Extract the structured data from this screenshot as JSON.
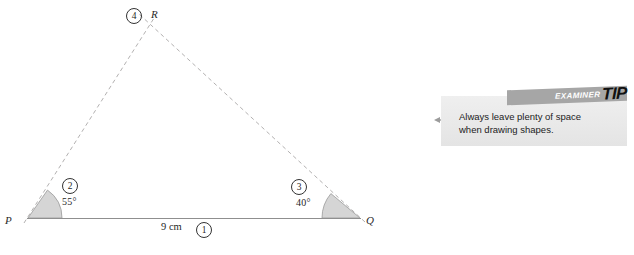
{
  "diagram": {
    "vertices": [
      {
        "name": "vertex-p-label",
        "label": "P",
        "x": 28,
        "y": 218
      },
      {
        "name": "vertex-q-label",
        "label": "Q",
        "x": 360,
        "y": 218
      },
      {
        "name": "vertex-r-label",
        "label": "R",
        "x": 148,
        "y": 28
      }
    ],
    "base_line": {
      "label": "9 cm",
      "from": "P",
      "to": "Q"
    },
    "angles": [
      {
        "at": "P",
        "value": "55°"
      },
      {
        "at": "Q",
        "value": "40°"
      }
    ],
    "step_markers": [
      {
        "id": "1",
        "text": "①",
        "describes": "base-line-9cm"
      },
      {
        "id": "2",
        "text": "②",
        "describes": "angle-at-p-55"
      },
      {
        "id": "3",
        "text": "③",
        "describes": "angle-at-q-40"
      },
      {
        "id": "4",
        "text": "④",
        "describes": "intersection-point-r"
      }
    ],
    "colors": {
      "line": "#8a8a8a",
      "dashed_line": "#b0aeae",
      "angle_fill": "#d4d4d4",
      "text": "#1f1f1f"
    }
  },
  "tip": {
    "banner_prefix": "EXAMINER",
    "banner_word": "TIP",
    "body_line1": "Always leave plenty of space",
    "body_line2": "when drawing shapes.",
    "body": "Always leave plenty of space when drawing shapes.",
    "background_color": "#ececec",
    "banner_color": "#a6a6a6"
  }
}
